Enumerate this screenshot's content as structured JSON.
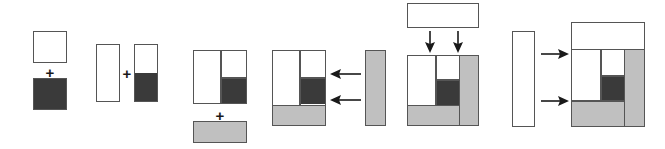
{
  "diagram": {
    "colors": {
      "white": "#ffffff",
      "dark": "#3a3a3a",
      "gray": "#c0c0c0",
      "outline": "#555555",
      "arrow": "#1a1a1a",
      "background": "#ffffff"
    },
    "operators": {
      "plus": "+"
    },
    "steps": [
      {
        "id": "step-1",
        "name": "white-square-plus-dark-square",
        "operator": "+",
        "parts": [
          {
            "name": "white-square",
            "fill": "#ffffff"
          },
          {
            "name": "dark-square",
            "fill": "#3a3a3a"
          }
        ]
      },
      {
        "id": "step-2",
        "name": "white-column-plus-half-dark-column",
        "operator": "+",
        "parts": [
          {
            "name": "white-column",
            "fill": "#ffffff"
          },
          {
            "name": "half-white-half-dark-column",
            "fill": "#ffffff,#3a3a3a"
          }
        ]
      },
      {
        "id": "step-3",
        "name": "two-column-block-plus-gray-bar",
        "operator": "+",
        "parts": [
          {
            "name": "two-column-block",
            "fill": "#ffffff,#3a3a3a"
          },
          {
            "name": "gray-horizontal-bar",
            "fill": "#c0c0c0"
          }
        ]
      },
      {
        "id": "step-4",
        "name": "block-with-gray-base-receiving-gray-column",
        "operator": "arrow-left",
        "parts": [
          {
            "name": "block-with-gray-base",
            "fill": "#ffffff,#3a3a3a,#c0c0c0"
          },
          {
            "name": "gray-vertical-bar",
            "fill": "#c0c0c0"
          }
        ],
        "arrows": 2,
        "arrow_direction": "left"
      },
      {
        "id": "step-5",
        "name": "block-receiving-white-top-bar",
        "operator": "arrow-down",
        "parts": [
          {
            "name": "white-horizontal-bar",
            "fill": "#ffffff"
          },
          {
            "name": "block-with-gray-column",
            "fill": "#ffffff,#3a3a3a,#c0c0c0"
          }
        ],
        "arrows": 2,
        "arrow_direction": "down"
      },
      {
        "id": "step-6",
        "name": "white-column-into-final-block",
        "operator": "arrow-right",
        "parts": [
          {
            "name": "white-vertical-bar",
            "fill": "#ffffff"
          },
          {
            "name": "final-composite-block",
            "fill": "#ffffff,#3a3a3a,#c0c0c0"
          }
        ],
        "arrows": 2,
        "arrow_direction": "right"
      }
    ]
  }
}
